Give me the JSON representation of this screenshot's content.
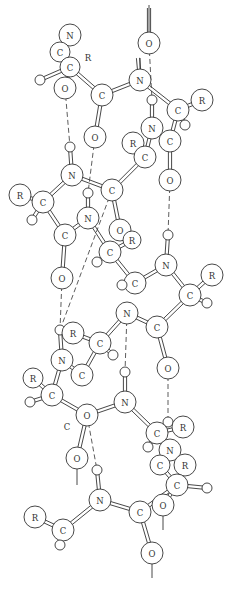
{
  "diagram": {
    "title": "",
    "colors": {
      "line": "#333333",
      "fill": "#ffffff"
    },
    "atoms": [
      {
        "id": "n1",
        "el": "N",
        "x": 70,
        "y": 35,
        "r": 11
      },
      {
        "id": "c1",
        "el": "C",
        "x": 60,
        "y": 52,
        "r": 10
      },
      {
        "id": "ca1",
        "el": "C",
        "x": 70,
        "y": 67,
        "r": 10
      },
      {
        "id": "h1",
        "el": "",
        "x": 40,
        "y": 80,
        "r": 5
      },
      {
        "id": "o1",
        "el": "O",
        "x": 65,
        "y": 88,
        "r": 11
      },
      {
        "id": "c2",
        "el": "C",
        "x": 102,
        "y": 95,
        "r": 11
      },
      {
        "id": "n2",
        "el": "N",
        "x": 140,
        "y": 80,
        "r": 11
      },
      {
        "id": "o0",
        "el": "O",
        "x": 149,
        "y": 43,
        "r": 11
      },
      {
        "id": "o2",
        "el": "O",
        "x": 95,
        "y": 137,
        "r": 11
      },
      {
        "id": "h2",
        "el": "",
        "x": 152,
        "y": 100,
        "r": 5
      },
      {
        "id": "ca2",
        "el": "C",
        "x": 178,
        "y": 110,
        "r": 11
      },
      {
        "id": "r2",
        "el": "R",
        "x": 202,
        "y": 100,
        "r": 11
      },
      {
        "id": "h2b",
        "el": "",
        "x": 185,
        "y": 125,
        "r": 5
      },
      {
        "id": "n3",
        "el": "N",
        "x": 152,
        "y": 128,
        "r": 11
      },
      {
        "id": "c3",
        "el": "C",
        "x": 170,
        "y": 141,
        "r": 11
      },
      {
        "id": "r3",
        "el": "R",
        "x": 133,
        "y": 143,
        "r": 11
      },
      {
        "id": "h3",
        "el": "",
        "x": 70,
        "y": 147,
        "r": 5
      },
      {
        "id": "ca3",
        "el": "C",
        "x": 145,
        "y": 157,
        "r": 11
      },
      {
        "id": "o3",
        "el": "O",
        "x": 170,
        "y": 180,
        "r": 11
      },
      {
        "id": "n4",
        "el": "N",
        "x": 72,
        "y": 175,
        "r": 11
      },
      {
        "id": "c4",
        "el": "C",
        "x": 112,
        "y": 190,
        "r": 11
      },
      {
        "id": "r4",
        "el": "R",
        "x": 20,
        "y": 195,
        "r": 11
      },
      {
        "id": "ca4",
        "el": "C",
        "x": 43,
        "y": 202,
        "r": 11
      },
      {
        "id": "h4",
        "el": "",
        "x": 32,
        "y": 220,
        "r": 5
      },
      {
        "id": "h4b",
        "el": "",
        "x": 88,
        "y": 193,
        "r": 5
      },
      {
        "id": "n5",
        "el": "N",
        "x": 88,
        "y": 218,
        "r": 11
      },
      {
        "id": "c5",
        "el": "C",
        "x": 65,
        "y": 235,
        "r": 11
      },
      {
        "id": "o4",
        "el": "O",
        "x": 120,
        "y": 230,
        "r": 11
      },
      {
        "id": "r5",
        "el": "R",
        "x": 132,
        "y": 240,
        "r": 9
      },
      {
        "id": "ca5",
        "el": "C",
        "x": 110,
        "y": 252,
        "r": 11
      },
      {
        "id": "h5",
        "el": "",
        "x": 97,
        "y": 262,
        "r": 5
      },
      {
        "id": "o5",
        "el": "O",
        "x": 62,
        "y": 278,
        "r": 11
      },
      {
        "id": "h6",
        "el": "",
        "x": 168,
        "y": 235,
        "r": 5
      },
      {
        "id": "n6",
        "el": "N",
        "x": 166,
        "y": 265,
        "r": 11
      },
      {
        "id": "c6",
        "el": "C",
        "x": 135,
        "y": 283,
        "r": 11
      },
      {
        "id": "h6b",
        "el": "",
        "x": 122,
        "y": 285,
        "r": 5
      },
      {
        "id": "r6",
        "el": "R",
        "x": 212,
        "y": 275,
        "r": 11
      },
      {
        "id": "ca6",
        "el": "C",
        "x": 190,
        "y": 295,
        "r": 11
      },
      {
        "id": "h6c",
        "el": "",
        "x": 207,
        "y": 303,
        "r": 5
      },
      {
        "id": "n7",
        "el": "N",
        "x": 127,
        "y": 313,
        "r": 11
      },
      {
        "id": "c7",
        "el": "C",
        "x": 157,
        "y": 327,
        "r": 11
      },
      {
        "id": "r7",
        "el": "R",
        "x": 73,
        "y": 333,
        "r": 11
      },
      {
        "id": "ca7",
        "el": "C",
        "x": 100,
        "y": 343,
        "r": 11
      },
      {
        "id": "h7",
        "el": "",
        "x": 113,
        "y": 355,
        "r": 5
      },
      {
        "id": "h7b",
        "el": "",
        "x": 60,
        "y": 330,
        "r": 5
      },
      {
        "id": "n8",
        "el": "N",
        "x": 62,
        "y": 360,
        "r": 11
      },
      {
        "id": "c8",
        "el": "C",
        "x": 82,
        "y": 375,
        "r": 11
      },
      {
        "id": "o7",
        "el": "O",
        "x": 168,
        "y": 368,
        "r": 11
      },
      {
        "id": "r8",
        "el": "R",
        "x": 33,
        "y": 378,
        "r": 10
      },
      {
        "id": "ca8",
        "el": "C",
        "x": 52,
        "y": 395,
        "r": 11
      },
      {
        "id": "h8",
        "el": "",
        "x": 30,
        "y": 402,
        "r": 5
      },
      {
        "id": "h8b",
        "el": "",
        "x": 125,
        "y": 372,
        "r": 5
      },
      {
        "id": "n9",
        "el": "N",
        "x": 125,
        "y": 402,
        "r": 11
      },
      {
        "id": "o8",
        "el": "O",
        "x": 87,
        "y": 415,
        "r": 11
      },
      {
        "id": "h9",
        "el": "",
        "x": 168,
        "y": 422,
        "r": 5
      },
      {
        "id": "r9",
        "el": "R",
        "x": 183,
        "y": 427,
        "r": 11
      },
      {
        "id": "ca9",
        "el": "C",
        "x": 157,
        "y": 433,
        "r": 11
      },
      {
        "id": "h9b",
        "el": "",
        "x": 148,
        "y": 447,
        "r": 5
      },
      {
        "id": "n10",
        "el": "N",
        "x": 170,
        "y": 450,
        "r": 11
      },
      {
        "id": "o9",
        "el": "O",
        "x": 77,
        "y": 458,
        "r": 11
      },
      {
        "id": "c10",
        "el": "C",
        "x": 160,
        "y": 465,
        "r": 10
      },
      {
        "id": "r10",
        "el": "R",
        "x": 185,
        "y": 465,
        "r": 11
      },
      {
        "id": "h10",
        "el": "",
        "x": 97,
        "y": 470,
        "r": 5
      },
      {
        "id": "ca10",
        "el": "C",
        "x": 177,
        "y": 485,
        "r": 11
      },
      {
        "id": "h10b",
        "el": "",
        "x": 207,
        "y": 488,
        "r": 5
      },
      {
        "id": "n11",
        "el": "N",
        "x": 100,
        "y": 500,
        "r": 11
      },
      {
        "id": "o10",
        "el": "O",
        "x": 163,
        "y": 505,
        "r": 11
      },
      {
        "id": "c11",
        "el": "C",
        "x": 140,
        "y": 512,
        "r": 11
      },
      {
        "id": "r11",
        "el": "R",
        "x": 35,
        "y": 517,
        "r": 11
      },
      {
        "id": "ca11",
        "el": "C",
        "x": 63,
        "y": 530,
        "r": 11
      },
      {
        "id": "h11",
        "el": "",
        "x": 60,
        "y": 545,
        "r": 5
      },
      {
        "id": "o11",
        "el": "O",
        "x": 152,
        "y": 553,
        "r": 11
      }
    ],
    "bonds": [
      [
        "n1",
        "c1"
      ],
      [
        "c1",
        "ca1"
      ],
      [
        "ca1",
        "h1"
      ],
      [
        "ca1",
        "o1"
      ],
      [
        "ca1",
        "c2"
      ],
      [
        "c2",
        "n2"
      ],
      [
        "c2",
        "o2"
      ],
      [
        "n2",
        "ca2"
      ],
      [
        "ca2",
        "r2"
      ],
      [
        "ca2",
        "h2b"
      ],
      [
        "h2",
        "n3"
      ],
      [
        "ca2",
        "c3"
      ],
      [
        "n3",
        "ca3"
      ],
      [
        "ca3",
        "r3"
      ],
      [
        "c3",
        "o3"
      ],
      [
        "ca3",
        "c4"
      ],
      [
        "c4",
        "n4"
      ],
      [
        "h3",
        "n4"
      ],
      [
        "n4",
        "ca4"
      ],
      [
        "ca4",
        "r4"
      ],
      [
        "ca4",
        "h4"
      ],
      [
        "ca4",
        "c5"
      ],
      [
        "c5",
        "n5"
      ],
      [
        "n5",
        "h4b"
      ],
      [
        "c4",
        "o4"
      ],
      [
        "n5",
        "ca5"
      ],
      [
        "ca5",
        "h5"
      ],
      [
        "ca5",
        "r5"
      ],
      [
        "c5",
        "o5"
      ],
      [
        "ca5",
        "c6"
      ],
      [
        "c6",
        "n6"
      ],
      [
        "n6",
        "h6"
      ],
      [
        "n6",
        "ca6"
      ],
      [
        "ca6",
        "r6"
      ],
      [
        "ca6",
        "h6c"
      ],
      [
        "c6",
        "h6b"
      ],
      [
        "ca6",
        "c7"
      ],
      [
        "c7",
        "n7"
      ],
      [
        "n7",
        "ca7"
      ],
      [
        "ca7",
        "r7"
      ],
      [
        "ca7",
        "h7"
      ],
      [
        "c7",
        "o7"
      ],
      [
        "ca7",
        "c8"
      ],
      [
        "c8",
        "n8"
      ],
      [
        "n8",
        "h7b"
      ],
      [
        "n8",
        "ca8"
      ],
      [
        "ca8",
        "r8"
      ],
      [
        "ca8",
        "h8"
      ],
      [
        "ca8",
        "o8"
      ],
      [
        "o8",
        "n9"
      ],
      [
        "n9",
        "h8b"
      ],
      [
        "n9",
        "ca9"
      ],
      [
        "ca9",
        "h9b"
      ],
      [
        "ca9",
        "r9"
      ],
      [
        "ca9",
        "h9"
      ],
      [
        "ca9",
        "n10"
      ],
      [
        "n10",
        "c10"
      ],
      [
        "c10",
        "ca10"
      ],
      [
        "ca10",
        "r10"
      ],
      [
        "ca10",
        "h10b"
      ],
      [
        "ca10",
        "c11"
      ],
      [
        "o8",
        "o9"
      ],
      [
        "c11",
        "n11"
      ],
      [
        "n11",
        "h10"
      ],
      [
        "n11",
        "ca11"
      ],
      [
        "ca11",
        "r11"
      ],
      [
        "ca11",
        "h11"
      ],
      [
        "c11",
        "o11"
      ],
      [
        "ca10",
        "o10"
      ]
    ],
    "double_bonds": [
      [
        "o0top",
        "o0"
      ],
      [
        "n2top",
        "n2"
      ]
    ],
    "hbonds": [
      [
        "o0",
        "h2"
      ],
      [
        "o1",
        "h3"
      ],
      [
        "o2",
        "h4b"
      ],
      [
        "o3",
        "h6"
      ],
      [
        "c4",
        "h7b"
      ],
      [
        "o5",
        "h7b"
      ],
      [
        "n7",
        "h8b"
      ],
      [
        "o7",
        "h9"
      ],
      [
        "o8",
        "h10"
      ]
    ],
    "stubs": [
      {
        "x1": 149,
        "y1": 32,
        "x2": 149,
        "y2": 5
      },
      {
        "x1": 140,
        "y1": 69,
        "x2": 140,
        "y2": 58
      },
      {
        "x1": 77,
        "y1": 469,
        "x2": 77,
        "y2": 485
      },
      {
        "x1": 163,
        "y1": 516,
        "x2": 163,
        "y2": 530
      },
      {
        "x1": 152,
        "y1": 564,
        "x2": 152,
        "y2": 578
      }
    ],
    "free_labels": [
      {
        "text": "R",
        "x": 88,
        "y": 58
      },
      {
        "text": "C",
        "x": 67,
        "y": 427
      }
    ]
  }
}
